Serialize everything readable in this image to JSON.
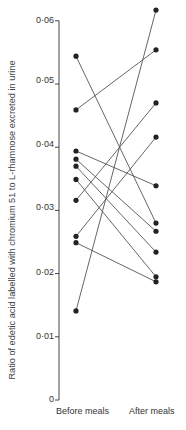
{
  "chart_data": {
    "type": "line",
    "title": "",
    "xlabel": "",
    "ylabel": "Ratio of edetic acid labelled with chromium 51 to L-rhamnose excreted in urine",
    "categories": [
      "Before meals",
      "After meals"
    ],
    "ylim": [
      0,
      0.06
    ],
    "yticks": [
      "0",
      "0·01",
      "0·02",
      "0·03",
      "0·04",
      "0·05",
      "0·06"
    ],
    "grid": false,
    "legend": null,
    "series": [
      {
        "name": "subject-1",
        "values": [
          0.0544,
          0.028
        ]
      },
      {
        "name": "subject-2",
        "values": [
          0.0459,
          0.0554
        ]
      },
      {
        "name": "subject-3",
        "values": [
          0.0394,
          0.0339
        ]
      },
      {
        "name": "subject-4",
        "values": [
          0.0381,
          0.0267
        ]
      },
      {
        "name": "subject-5",
        "values": [
          0.037,
          0.0234
        ]
      },
      {
        "name": "subject-6",
        "values": [
          0.0349,
          0.0195
        ]
      },
      {
        "name": "subject-7",
        "values": [
          0.0316,
          0.047
        ]
      },
      {
        "name": "subject-8",
        "values": [
          0.0259,
          0.0416
        ]
      },
      {
        "name": "subject-9",
        "values": [
          0.0249,
          0.0187
        ]
      },
      {
        "name": "subject-10",
        "values": [
          0.0141,
          0.0617
        ]
      }
    ]
  },
  "colors": {
    "line": "#555555",
    "marker": "#222222",
    "axis": "#444444"
  }
}
